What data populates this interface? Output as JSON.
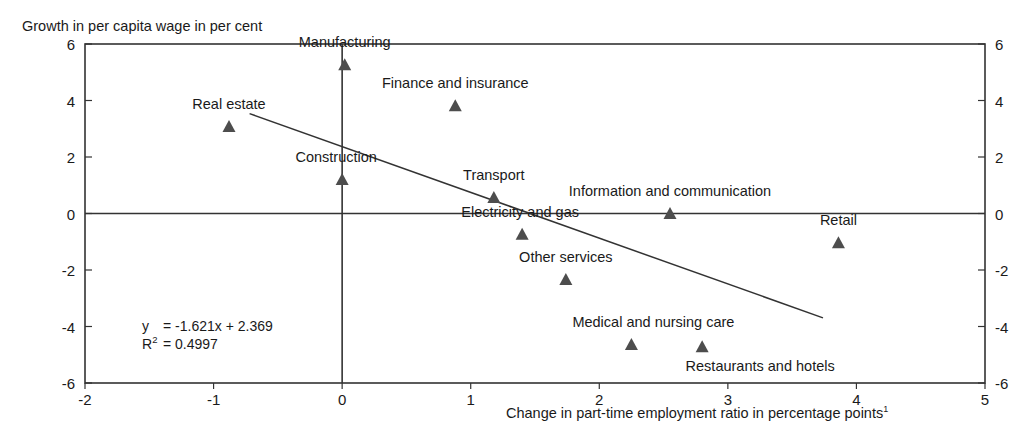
{
  "chart_data": {
    "type": "scatter",
    "title": "",
    "ylabel": "Growth in per capita wage in per cent",
    "xlabel": "Change in part-time employment ratio in percentage points",
    "xlabel_footnote": "1",
    "xlim": [
      -2,
      5
    ],
    "ylim": [
      -6,
      6
    ],
    "xticks": [
      -2,
      -1,
      0,
      1,
      2,
      3,
      4,
      5
    ],
    "xtick_labels": [
      "-2",
      "-1",
      "0",
      "1",
      "2",
      "3",
      "4",
      "5"
    ],
    "yticks": [
      -6,
      -4,
      -2,
      0,
      2,
      4,
      6
    ],
    "ytick_labels": [
      "-6",
      "-4",
      "-2",
      "0",
      "2",
      "4",
      "6"
    ],
    "right_axis_labels": [
      "6",
      "4",
      "2",
      "0",
      "-2",
      "-4",
      "-6"
    ],
    "grid": false,
    "legend": "none",
    "zero_lines": true,
    "marker": "triangle",
    "marker_color": "#4d4d4d",
    "line_color": "#333333",
    "axis_color": "#333333",
    "points": [
      {
        "label": "Manufacturing",
        "x": 0.02,
        "y": 5.28,
        "label_dx": 0,
        "label_dy": -24
      },
      {
        "label": "Finance and insurance",
        "x": 0.88,
        "y": 3.83,
        "label_dx": 0,
        "label_dy": -24
      },
      {
        "label": "Real estate",
        "x": -0.88,
        "y": 3.1,
        "label_dx": 0,
        "label_dy": -24
      },
      {
        "label": "Construction",
        "x": 0.0,
        "y": 1.22,
        "label_dx": -6,
        "label_dy": -24
      },
      {
        "label": "Transport",
        "x": 1.18,
        "y": 0.58,
        "label_dx": 0,
        "label_dy": -24
      },
      {
        "label": "Information and communication",
        "x": 2.55,
        "y": 0.02,
        "label_dx": 0,
        "label_dy": -24
      },
      {
        "label": "Electricity and gas",
        "x": 1.4,
        "y": -0.72,
        "label_dx": -2,
        "label_dy": -24
      },
      {
        "label": "Retail",
        "x": 3.86,
        "y": -1.02,
        "label_dx": 0,
        "label_dy": -24
      },
      {
        "label": "Other services",
        "x": 1.74,
        "y": -2.32,
        "label_dx": 0,
        "label_dy": -24
      },
      {
        "label": "Medical and nursing care",
        "x": 2.25,
        "y": -4.62,
        "label_dx": 22,
        "label_dy": -24
      },
      {
        "label": "Restaurants and hotels",
        "x": 2.8,
        "y": -4.7,
        "label_dx": 58,
        "label_dy": 18
      }
    ],
    "trendline": {
      "slope": -1.621,
      "intercept": 2.369,
      "x_start": -0.72,
      "x_end": 3.74
    },
    "annotation": {
      "equation_lhs": "y",
      "equation_rhs": "= -1.621x + 2.369",
      "r2_lhs": "R",
      "r2_sup": "2",
      "r2_rhs": "= 0.4997"
    }
  }
}
